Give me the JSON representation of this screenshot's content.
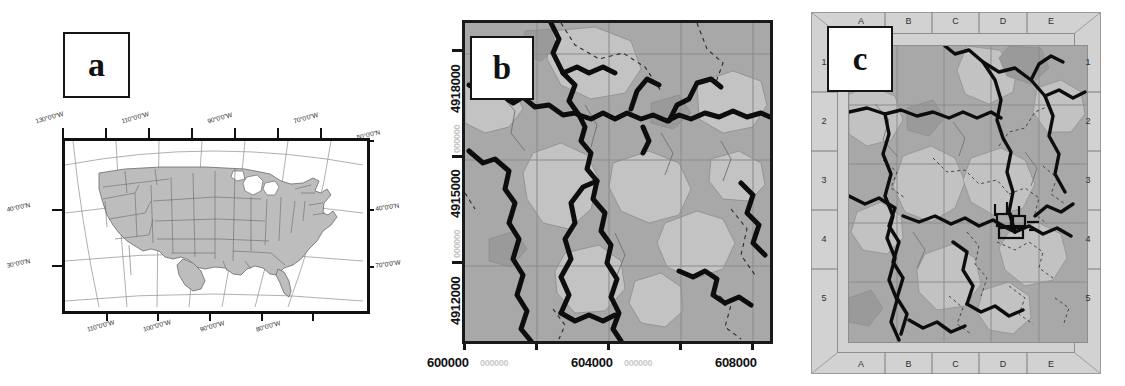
{
  "figure": {
    "panel_count": 3,
    "background_color": "#ffffff"
  },
  "panels": [
    {
      "id": "a",
      "label": "a",
      "kind": "locator-map",
      "description": "Conterminous United States locator map with graticule",
      "frame_color": "#111111",
      "land_color": "#bdbdbd",
      "axis_labels": {
        "top": [
          "130°0'0\"W",
          "110°0'0\"W",
          "90°0'0\"W",
          "70°0'0\"W"
        ],
        "bottom": [
          "110°0'0\"W",
          "100°0'0\"W",
          "90°0'0\"W",
          "80°0'0\"W"
        ],
        "left": [
          "40°0'0\"N",
          "30°0'0\"N"
        ],
        "right": [
          "50°0'0\"N",
          "40°0'0\"N",
          "70°0'0\"W"
        ]
      }
    },
    {
      "id": "b",
      "label": "b",
      "kind": "topographic-map",
      "description": "UTM topographic map with streams, contours and grid",
      "frame_color": "#1a1a1a",
      "base_color": "#a8a8a8",
      "axis_labels": {
        "y_major": [
          "4918000",
          "4915000",
          "4912000"
        ],
        "y_minor": [
          "000000",
          "000000"
        ],
        "x_major": [
          "600000",
          "604000",
          "608000"
        ],
        "x_minor": [
          "000000",
          "000000"
        ]
      }
    },
    {
      "id": "c",
      "label": "c",
      "kind": "gridded-detail-map",
      "description": "Detail map with alphanumeric index grid frame",
      "frame_color": "#7d7d7d",
      "frame_fill": "#d2d2d2",
      "base_color": "#a8a8a8",
      "grid_index": {
        "columns_top": [
          "A",
          "B",
          "C",
          "D",
          "E"
        ],
        "columns_bottom": [
          "A",
          "B",
          "C",
          "D",
          "E"
        ],
        "rows_left": [
          "1",
          "2",
          "3",
          "4",
          "5"
        ],
        "rows_right": [
          "1",
          "2",
          "3",
          "4",
          "5"
        ]
      }
    }
  ]
}
